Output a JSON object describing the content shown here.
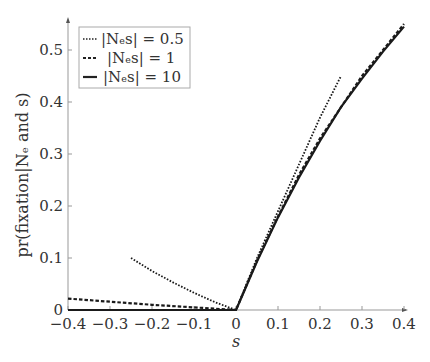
{
  "chart_data": {
    "type": "line",
    "title": "",
    "xlabel": "s",
    "ylabel": "pr(fixation|N_e and s)",
    "xlim": [
      -0.4,
      0.4
    ],
    "ylim": [
      0,
      0.55
    ],
    "grid": false,
    "legend_position": "upper left",
    "x_ticks": [
      "-0.4",
      "-0.3",
      "-0.2",
      "-0.1",
      "0",
      "0.1",
      "0.2",
      "0.3",
      "0.4"
    ],
    "y_ticks": [
      "0",
      "0.1",
      "0.2",
      "0.3",
      "0.4",
      "0.5"
    ],
    "series": [
      {
        "name": "|N_e s| = 0.5",
        "style": "dotted",
        "x": [
          -0.25,
          -0.2,
          -0.15,
          -0.1,
          -0.05,
          0,
          0.05,
          0.1,
          0.15,
          0.2,
          0.25
        ],
        "y": [
          0.1,
          0.075,
          0.053,
          0.033,
          0.015,
          0,
          0.1,
          0.19,
          0.28,
          0.37,
          0.45
        ]
      },
      {
        "name": "|N_e s| = 1",
        "style": "dashed",
        "x": [
          -0.4,
          -0.3,
          -0.2,
          -0.1,
          0,
          0.05,
          0.1,
          0.15,
          0.2,
          0.25,
          0.3,
          0.35,
          0.4
        ],
        "y": [
          0.022,
          0.016,
          0.01,
          0.005,
          0,
          0.095,
          0.18,
          0.26,
          0.33,
          0.39,
          0.45,
          0.5,
          0.55
        ]
      },
      {
        "name": "|N_e s| = 10",
        "style": "solid",
        "x": [
          -0.4,
          -0.2,
          0,
          0.05,
          0.1,
          0.15,
          0.2,
          0.25,
          0.3,
          0.35,
          0.4
        ],
        "y": [
          0,
          0,
          0,
          0.093,
          0.178,
          0.255,
          0.325,
          0.39,
          0.445,
          0.497,
          0.545
        ]
      }
    ]
  },
  "legend": {
    "items": [
      {
        "label": "|Nₑs| = 0.5"
      },
      {
        "label": "|Nₑs| = 1"
      },
      {
        "label": "|Nₑs| = 10"
      }
    ]
  },
  "axes": {
    "xlabel": "s",
    "ylabel": "pr(fixation|Nₑ and s)"
  }
}
